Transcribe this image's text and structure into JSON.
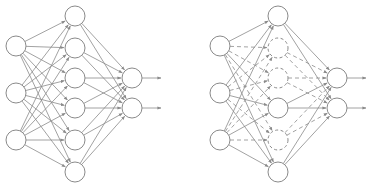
{
  "figure": {
    "caption_fragment": "",
    "stroke_color": "#8a8a8a",
    "node_fill": "#ffffff",
    "node_radius": 10
  },
  "networks": [
    {
      "name": "standard-network",
      "input_nodes": [
        [
          16,
          46
        ],
        [
          16,
          93
        ],
        [
          16,
          140
        ]
      ],
      "hidden_nodes": [
        {
          "pos": [
            75,
            16
          ],
          "dropped": false
        },
        {
          "pos": [
            75,
            48
          ],
          "dropped": false
        },
        {
          "pos": [
            75,
            78
          ],
          "dropped": false
        },
        {
          "pos": [
            75,
            108
          ],
          "dropped": false
        },
        {
          "pos": [
            75,
            140
          ],
          "dropped": false
        },
        {
          "pos": [
            75,
            172
          ],
          "dropped": false
        }
      ],
      "output_nodes": [
        [
          132,
          78
        ],
        [
          132,
          108
        ]
      ],
      "output_arrow_end_x": 161
    },
    {
      "name": "dropout-network",
      "input_nodes": [
        [
          220,
          46
        ],
        [
          220,
          93
        ],
        [
          220,
          140
        ]
      ],
      "hidden_nodes": [
        {
          "pos": [
            278,
            16
          ],
          "dropped": false
        },
        {
          "pos": [
            278,
            48
          ],
          "dropped": true
        },
        {
          "pos": [
            278,
            78
          ],
          "dropped": true
        },
        {
          "pos": [
            278,
            108
          ],
          "dropped": false
        },
        {
          "pos": [
            278,
            140
          ],
          "dropped": true
        },
        {
          "pos": [
            278,
            172
          ],
          "dropped": false
        }
      ],
      "output_nodes": [
        [
          337,
          78
        ],
        [
          337,
          108
        ]
      ],
      "output_arrow_end_x": 366
    }
  ]
}
